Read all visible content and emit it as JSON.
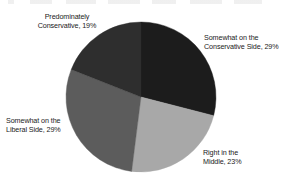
{
  "chart_data": {
    "type": "pie",
    "title": "",
    "subtitle": "",
    "xlabel": "",
    "ylabel": "",
    "legend_position": "none",
    "grid": false,
    "labels_position": "outside",
    "units": "percent",
    "total": 100,
    "categories": [
      "Somewhat on the Conservative Side",
      "Right in the Middle",
      "Somewhat on the Liberal Side",
      "Predominately Conservative"
    ],
    "values": [
      29,
      23,
      29,
      19
    ],
    "colors": [
      "#1c1c1c",
      "#a8a8a8",
      "#5c5c5c",
      "#2e2e2e"
    ],
    "start_angle_deg": 0,
    "direction": "clockwise",
    "slices": [
      {
        "name": "Somewhat on the Conservative Side",
        "value": 29,
        "value_text": "29%",
        "label_text": "Somewhat on the\nConservative Side, 29%",
        "color": "#1c1c1c",
        "start_deg": 0,
        "end_deg": 104.4
      },
      {
        "name": "Right in the Middle",
        "value": 23,
        "value_text": "23%",
        "label_text": "Right in the\nMiddle, 23%",
        "color": "#a8a8a8",
        "start_deg": 104.4,
        "end_deg": 187.2
      },
      {
        "name": "Somewhat on the Liberal Side",
        "value": 29,
        "value_text": "29%",
        "label_text": "Somewhat on the\nLiberal Side, 29%",
        "color": "#5c5c5c",
        "start_deg": 187.2,
        "end_deg": 291.6
      },
      {
        "name": "Predominately Conservative",
        "value": 19,
        "value_text": "19%",
        "label_text": "Predominately\nConservative, 19%",
        "color": "#2e2e2e",
        "start_deg": 291.6,
        "end_deg": 360
      }
    ]
  },
  "figure": {
    "background": "#ffffff",
    "center_x": 141,
    "center_y": 97,
    "radius": 75
  }
}
